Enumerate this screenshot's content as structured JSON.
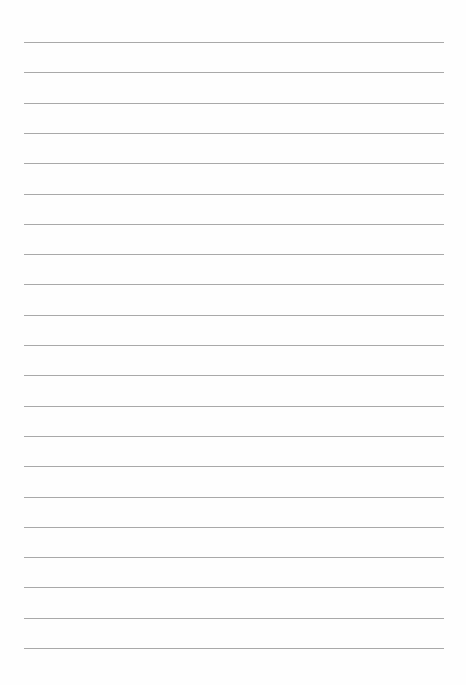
{
  "page": {
    "type": "lined-paper",
    "background_color": "#fefefe",
    "rule_color": "#a9a9a9",
    "rule_count": 21,
    "first_rule_y": 42,
    "rule_spacing": 30.3,
    "rule_left": 24,
    "rule_width": 420
  }
}
